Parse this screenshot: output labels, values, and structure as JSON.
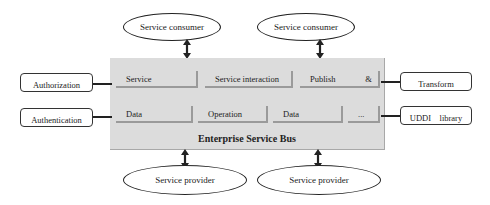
{
  "diagram": {
    "title": "Enterprise Service Bus",
    "consumers": [
      {
        "label": "Service consumer"
      },
      {
        "label": "Service consumer"
      }
    ],
    "providers": [
      {
        "label": "Service provider"
      },
      {
        "label": "Service provider"
      }
    ],
    "left_boxes": [
      {
        "label": "Authorization"
      },
      {
        "label": "Authentication"
      }
    ],
    "right_boxes": [
      {
        "label": "Transform"
      },
      {
        "label": "UDDI    library"
      }
    ],
    "modules_row1": [
      {
        "label": "Service"
      },
      {
        "label": "Service interaction"
      },
      {
        "label": "Publish              &"
      }
    ],
    "modules_row2": [
      {
        "label": "Data"
      },
      {
        "label": "Operation"
      },
      {
        "label": "Data"
      },
      {
        "label": "..."
      }
    ],
    "colors": {
      "bus_fill": "#dcdcdc",
      "module_shadow": "#9a9a9a",
      "stroke": "#222222"
    }
  }
}
